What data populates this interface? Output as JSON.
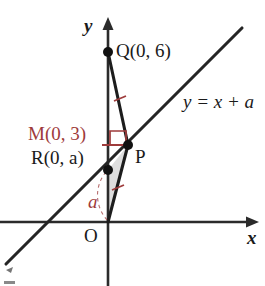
{
  "figure": {
    "kind": "coordinate-geometry-diagram",
    "width": 265,
    "height": 286,
    "background": "#ffffff"
  },
  "colors": {
    "ink": "#1a1a1a",
    "accent_red": "#9e3b3b",
    "shade_fill": "#dcdcdc",
    "axis": "#2b2b2b"
  },
  "axes": {
    "x_axis_label": "x",
    "y_axis_label": "y",
    "origin_label": "O"
  },
  "points": {
    "q": {
      "label": "Q(0, 6)",
      "name": "Q",
      "coords": [
        0,
        6
      ]
    },
    "m": {
      "label": "M(0, 3)",
      "name": "M",
      "coords": [
        0,
        3
      ]
    },
    "r": {
      "label": "R(0, a)",
      "name": "R",
      "coords": [
        0,
        "a"
      ]
    },
    "p": {
      "label": "P",
      "name": "P"
    }
  },
  "line": {
    "equation": "y = x + a"
  },
  "annotations": {
    "segment_a_label": "a",
    "right_angle_at_p": "right-angle-mark",
    "tick_qp": "congruence-tick",
    "tick_po": "congruence-tick"
  }
}
